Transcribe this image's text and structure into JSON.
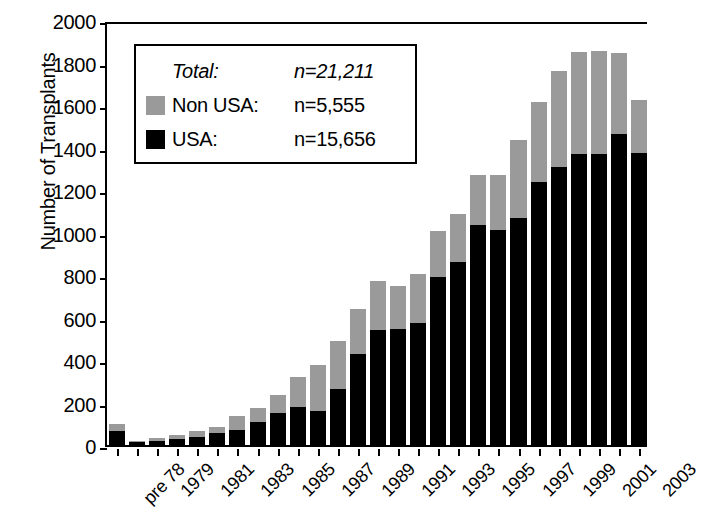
{
  "chart_data": {
    "type": "bar",
    "subtype": "stacked-vertical",
    "title": "",
    "xlabel": "",
    "ylabel": "Number of Transplants",
    "ylim": [
      0,
      2000
    ],
    "yticks": [
      0,
      200,
      400,
      600,
      800,
      1000,
      1200,
      1400,
      1600,
      1800,
      2000
    ],
    "ytick_labels": [
      "0",
      "200",
      "400",
      "600",
      "800",
      "1000",
      "1200",
      "1400",
      "1600",
      "1800",
      "2000"
    ],
    "grid": false,
    "legend_position": "upper-left-inside",
    "categories": [
      "pre 78",
      "1978",
      "1979",
      "1980",
      "1981",
      "1982",
      "1983",
      "1984",
      "1985",
      "1986",
      "1987",
      "1988",
      "1989",
      "1990",
      "1991",
      "1992",
      "1993",
      "1994",
      "1995",
      "1996",
      "1997",
      "1998",
      "1999",
      "2000",
      "2001",
      "2002",
      "2003"
    ],
    "xtick_labels_shown": [
      "pre 78",
      "1979",
      "1981",
      "1983",
      "1985",
      "1987",
      "1989",
      "1991",
      "1993",
      "1995",
      "1997",
      "1999",
      "2001",
      "2003"
    ],
    "series": [
      {
        "name": "USA",
        "color": "#000000",
        "values": [
          65,
          12,
          20,
          30,
          40,
          55,
          70,
          110,
          150,
          180,
          160,
          265,
          430,
          540,
          545,
          575,
          790,
          860,
          1035,
          1010,
          1070,
          1240,
          1310,
          1370,
          1370,
          1465,
          1375
        ]
      },
      {
        "name": "Non USA",
        "color": "#9a9a9a",
        "values": [
          35,
          8,
          12,
          18,
          25,
          30,
          65,
          65,
          85,
          140,
          215,
          225,
          210,
          230,
          205,
          230,
          215,
          225,
          235,
          260,
          365,
          375,
          450,
          480,
          485,
          380,
          250
        ]
      }
    ],
    "totals": [
      100,
      20,
      32,
      48,
      65,
      85,
      135,
      175,
      235,
      320,
      375,
      490,
      640,
      770,
      750,
      805,
      1005,
      1085,
      1270,
      1270,
      1435,
      1615,
      1760,
      1850,
      1855,
      1845,
      1625
    ]
  },
  "legend": {
    "rows": [
      {
        "swatch": "none",
        "label": "Total:",
        "value": "n=21,211",
        "italic": true
      },
      {
        "swatch": "gray",
        "label": "Non USA:",
        "value": "n=5,555",
        "italic": false
      },
      {
        "swatch": "black",
        "label": "USA:",
        "value": "n=15,656",
        "italic": false
      }
    ]
  }
}
